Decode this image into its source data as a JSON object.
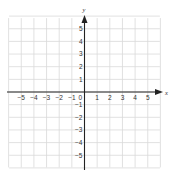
{
  "figure": {
    "type": "coordinate-plane",
    "x_axis_label": "x",
    "y_axis_label": "y",
    "x_range": [
      -6,
      6
    ],
    "y_range": [
      -6,
      6
    ],
    "x_ticks": [
      "−5",
      "−4",
      "−3",
      "−2",
      "−1",
      "1",
      "2",
      "3",
      "4",
      "5"
    ],
    "x_tick_values": [
      -5,
      -4,
      -3,
      -2,
      -1,
      1,
      2,
      3,
      4,
      5
    ],
    "y_ticks": [
      "5",
      "4",
      "3",
      "2",
      "1",
      "−1",
      "−2",
      "−3",
      "−4",
      "−5"
    ],
    "y_tick_values": [
      5,
      4,
      3,
      2,
      1,
      -1,
      -2,
      -3,
      -4,
      -5
    ],
    "origin_label": "0",
    "grid": true,
    "colors": {
      "grid": "#d9d9d9",
      "axis": "#222222",
      "text": "#333333"
    }
  }
}
